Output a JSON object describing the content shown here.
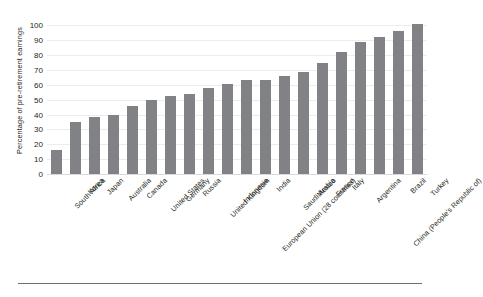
{
  "chart_data": {
    "type": "bar",
    "title": "",
    "subtitle": "",
    "xlabel": "",
    "ylabel": "Percentage of pre-retirement earnings",
    "ylim": [
      0,
      105
    ],
    "ytick_values": [
      0,
      10,
      20,
      30,
      40,
      50,
      60,
      70,
      80,
      90,
      100
    ],
    "ytick_labels": [
      "0",
      "10",
      "20",
      "30",
      "40",
      "50",
      "60",
      "70",
      "80",
      "90",
      "100"
    ],
    "grid": true,
    "legend": "none",
    "bar_color": "#808285",
    "categories": [
      "South Africa",
      "Korea",
      "Japan",
      "Australia",
      "Canada",
      "United States",
      "Germany",
      "Russia",
      "United Kingdom",
      "Indonesia",
      "European Union (28 countries)",
      "India",
      "Saudi Arabia",
      "Mexico",
      "France",
      "Italy",
      "Argentina",
      "China (People's Republic of)",
      "Brazil",
      "Turkey"
    ],
    "values": [
      16.0,
      35.0,
      38.5,
      40.0,
      46.0,
      50.0,
      52.5,
      54.0,
      58.0,
      60.5,
      63.0,
      63.5,
      66.0,
      68.5,
      74.5,
      82.0,
      89.0,
      92.0,
      96.5,
      101.0
    ]
  }
}
